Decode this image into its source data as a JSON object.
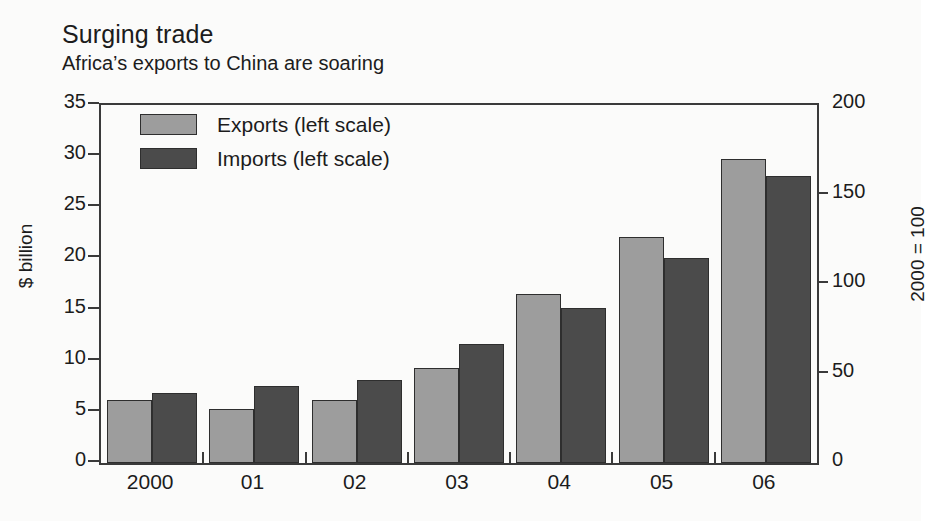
{
  "chart_data": {
    "type": "bar",
    "title": "Surging trade",
    "subtitle": "Africa’s exports to China are soaring",
    "xlabel": "",
    "ylabel": "$ billion",
    "ylabel_right": "2000 = 100",
    "categories": [
      "2000",
      "01",
      "02",
      "03",
      "04",
      "05",
      "06"
    ],
    "series": [
      {
        "name": "Exports (left scale)",
        "color": "#9d9d9d",
        "values": [
          6.2,
          5.3,
          6.2,
          9.3,
          16.5,
          22.1,
          29.7
        ]
      },
      {
        "name": "Imports (left scale)",
        "color": "#4b4b4b",
        "values": [
          6.8,
          7.5,
          8.1,
          11.6,
          15.2,
          20.0,
          28.1
        ]
      }
    ],
    "ylim": [
      0,
      35
    ],
    "yticks": [
      0,
      5,
      10,
      15,
      20,
      25,
      30,
      35
    ],
    "ylim_right": [
      0,
      200
    ],
    "yticks_right": [
      0,
      50,
      100,
      150,
      200
    ],
    "grid": false,
    "legend_position": "top-left"
  },
  "legend": {
    "entries": [
      {
        "label": "Exports (left scale)"
      },
      {
        "label": "Imports (left scale)"
      }
    ]
  }
}
